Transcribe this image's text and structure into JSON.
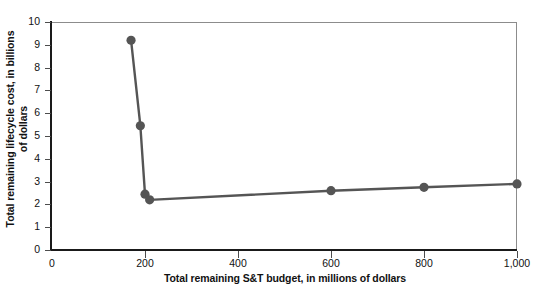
{
  "chart_data": {
    "type": "line",
    "title": "",
    "xlabel": "Total remaining S&T budget, in millions of dollars",
    "ylabel": "Total remaining lifecycle cost, in billions of dollars",
    "ylabel_line1": "Total remaining lifecycle cost, in billions",
    "ylabel_line2": "of dollars",
    "xlim": [
      0,
      1000
    ],
    "ylim": [
      0,
      10
    ],
    "grid": false,
    "legend": null,
    "marker": "circle",
    "series": [
      {
        "name": "Total remaining lifecycle cost",
        "color": "#555555",
        "points": [
          {
            "x": 170,
            "y": 9.2
          },
          {
            "x": 190,
            "y": 5.45
          },
          {
            "x": 200,
            "y": 2.45
          },
          {
            "x": 210,
            "y": 2.2
          },
          {
            "x": 600,
            "y": 2.6
          },
          {
            "x": 800,
            "y": 2.75
          },
          {
            "x": 1000,
            "y": 2.9
          }
        ]
      }
    ],
    "xticks": [
      {
        "value": 0,
        "label": "0"
      },
      {
        "value": 200,
        "label": "200"
      },
      {
        "value": 400,
        "label": "400"
      },
      {
        "value": 600,
        "label": "600"
      },
      {
        "value": 800,
        "label": "800"
      },
      {
        "value": 1000,
        "label": "1,000"
      }
    ],
    "yticks": [
      {
        "value": 0,
        "label": "0"
      },
      {
        "value": 1,
        "label": "1"
      },
      {
        "value": 2,
        "label": "2"
      },
      {
        "value": 3,
        "label": "3"
      },
      {
        "value": 4,
        "label": "4"
      },
      {
        "value": 5,
        "label": "5"
      },
      {
        "value": 6,
        "label": "6"
      },
      {
        "value": 7,
        "label": "7"
      },
      {
        "value": 8,
        "label": "8"
      },
      {
        "value": 9,
        "label": "9"
      },
      {
        "value": 10,
        "label": "10"
      }
    ],
    "colors": {
      "series": "#555555",
      "axis": "#1a1a1a",
      "frame": "#8c8c8c",
      "text": "#111111",
      "background": "#ffffff"
    }
  }
}
